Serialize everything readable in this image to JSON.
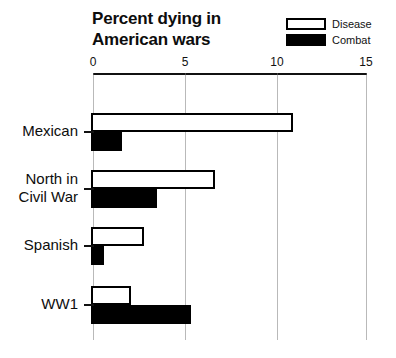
{
  "chart_data": {
    "type": "bar",
    "orientation": "horizontal",
    "title": "Percent dying in American wars",
    "title_lines": [
      "Percent dying in",
      "American wars"
    ],
    "xlabel": "",
    "ylabel": "",
    "xlim": [
      0,
      15
    ],
    "xticks": [
      0,
      5,
      10,
      15
    ],
    "xtick_labels": [
      "0",
      "5",
      "10",
      "15"
    ],
    "grid": true,
    "grid_axis": "x",
    "legend_position": "top-right",
    "categories": [
      "Mexican",
      "North in Civil War",
      "Spanish",
      "WW1"
    ],
    "category_label_lines": [
      [
        "Mexican"
      ],
      [
        "North in",
        "Civil War"
      ],
      [
        "Spanish"
      ],
      [
        "WW1"
      ]
    ],
    "series": [
      {
        "name": "Disease",
        "color": "#ffffff",
        "edge_color": "#000000",
        "values": [
          11.0,
          6.7,
          2.8,
          2.1
        ]
      },
      {
        "name": "Combat",
        "color": "#000000",
        "edge_color": "#000000",
        "values": [
          1.6,
          3.5,
          0.6,
          5.4
        ]
      }
    ]
  },
  "legend": {
    "items": [
      {
        "label": "Disease",
        "style": "hollow"
      },
      {
        "label": "Combat",
        "style": "filled"
      }
    ]
  },
  "colors": {
    "background": "#ffffff",
    "ink": "#000000",
    "gridline": "#b9b9b9",
    "axis": "#111111"
  }
}
